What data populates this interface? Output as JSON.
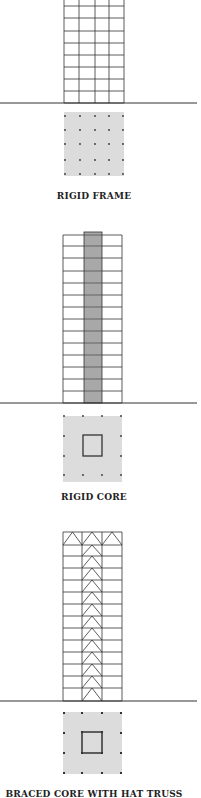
{
  "colors": {
    "line": "#333333",
    "plan_fill": "#dcdcdc",
    "core_fill": "#a8a8a8",
    "dot": "#333333",
    "label": "#222222"
  },
  "panels": [
    {
      "label": "RIGID FRAME",
      "type": "rigid-frame",
      "label_y": 191,
      "building": {
        "x": 64,
        "w": 60,
        "top": -4,
        "ground": 103,
        "cols": [
          64,
          79,
          95,
          109,
          124
        ],
        "floors": [
          6,
          18,
          31,
          43,
          55,
          67,
          79,
          91,
          103
        ]
      },
      "ground_line": {
        "x1": 0,
        "x2": 197,
        "y": 103
      },
      "plan": {
        "x": 64,
        "y": 112,
        "w": 60,
        "h": 64,
        "dots_x": [
          65,
          80,
          95,
          109,
          123
        ],
        "dots_y": [
          116,
          130,
          144,
          160,
          174
        ]
      }
    },
    {
      "label": "RIGID CORE",
      "type": "rigid-core",
      "label_y": 492,
      "building": {
        "x": 63,
        "w": 59,
        "top": 235,
        "ground": 403,
        "core_x": 84,
        "core_w": 18,
        "core_top": 232,
        "floors": [
          235,
          246,
          258,
          271,
          283,
          295,
          307,
          319,
          331,
          343,
          355,
          367,
          379,
          391,
          403
        ]
      },
      "ground_line": {
        "x1": 0,
        "x2": 197,
        "y": 403
      },
      "plan": {
        "x": 63,
        "y": 416,
        "w": 59,
        "h": 66,
        "core": {
          "x": 83,
          "y": 435,
          "w": 19,
          "h": 21
        },
        "dots": [
          [
            64,
            416
          ],
          [
            83,
            416
          ],
          [
            102,
            416
          ],
          [
            121,
            416
          ],
          [
            64,
            436
          ],
          [
            121,
            436
          ],
          [
            64,
            456
          ],
          [
            121,
            456
          ],
          [
            64,
            475
          ],
          [
            83,
            475
          ],
          [
            102,
            475
          ],
          [
            121,
            475
          ]
        ]
      }
    },
    {
      "label": "BRACED CORE WITH HAT TRUSS",
      "type": "braced-core-hat-truss",
      "label_y": 789,
      "building": {
        "x": 63,
        "w": 59,
        "top": 532,
        "ground": 701,
        "cols": [
          63,
          82,
          102,
          122
        ],
        "floors": [
          532,
          545,
          556,
          568,
          580,
          592,
          604,
          616,
          628,
          640,
          652,
          664,
          676,
          688,
          701
        ]
      },
      "ground_line": {
        "x1": 0,
        "x2": 197,
        "y": 701
      },
      "plan": {
        "x": 63,
        "y": 712,
        "w": 59,
        "h": 62,
        "core": {
          "x": 82,
          "y": 732,
          "w": 20,
          "h": 21
        },
        "dots": [
          [
            64,
            713
          ],
          [
            82,
            713
          ],
          [
            102,
            713
          ],
          [
            121,
            713
          ],
          [
            64,
            733
          ],
          [
            121,
            733
          ],
          [
            64,
            753
          ],
          [
            121,
            753
          ],
          [
            64,
            773
          ],
          [
            82,
            773
          ],
          [
            102,
            773
          ],
          [
            121,
            773
          ]
        ]
      }
    }
  ]
}
